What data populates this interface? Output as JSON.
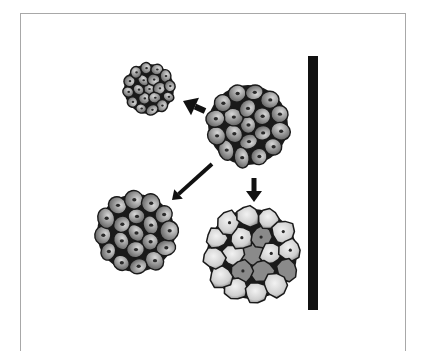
{
  "diagram": {
    "colors": {
      "background": "#ffffff",
      "frame": "#a8a8a8",
      "bar": "#111111",
      "cell_outline": "#1a1a1a",
      "cell_fill_dark": "#5e5e5e",
      "cell_fill_light": "#d8d8d8",
      "nucleus": "#2a2a2a",
      "necrotic_fill": "#8a8a8a",
      "necrotic_light": "#f2f2f2",
      "arrow": "#111111"
    },
    "bar": {
      "x": 308,
      "y": 56,
      "width": 10,
      "height": 254
    },
    "clusters": [
      {
        "id": "source",
        "label": "source-cluster",
        "cx": 248,
        "cy": 125,
        "r": 40,
        "cell_r": 9.5,
        "type": "normal"
      },
      {
        "id": "small",
        "label": "small-cluster",
        "cx": 149,
        "cy": 89,
        "r": 25,
        "cell_r": 6,
        "type": "normal"
      },
      {
        "id": "loose",
        "label": "loose-cluster",
        "cx": 136,
        "cy": 233,
        "r": 39,
        "cell_r": 9.5,
        "type": "normal"
      },
      {
        "id": "necrotic",
        "label": "necrotic-cluster",
        "cx": 252,
        "cy": 254,
        "r": 45,
        "cell_r": 11,
        "type": "necrotic"
      }
    ],
    "arrows": [
      {
        "id": "to-small",
        "x1": 205,
        "y1": 111,
        "x2": 183,
        "y2": 101,
        "width": 6
      },
      {
        "id": "to-loose",
        "x1": 212,
        "y1": 164,
        "x2": 172,
        "y2": 200,
        "width": 4
      },
      {
        "id": "to-necrotic",
        "x1": 254,
        "y1": 178,
        "x2": 254,
        "y2": 202,
        "width": 5
      }
    ]
  }
}
